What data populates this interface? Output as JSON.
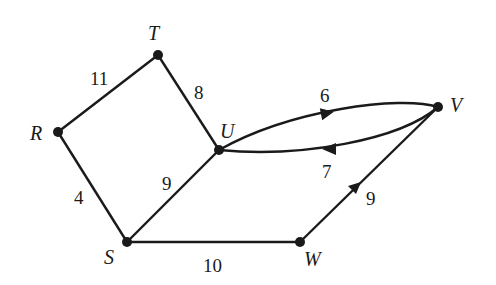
{
  "graph": {
    "nodes": [
      {
        "id": "T",
        "label": "T"
      },
      {
        "id": "R",
        "label": "R"
      },
      {
        "id": "U",
        "label": "U"
      },
      {
        "id": "V",
        "label": "V"
      },
      {
        "id": "S",
        "label": "S"
      },
      {
        "id": "W",
        "label": "W"
      }
    ],
    "edges": [
      {
        "from": "R",
        "to": "T",
        "weight": "11",
        "directed": false
      },
      {
        "from": "T",
        "to": "U",
        "weight": "8",
        "directed": false
      },
      {
        "from": "R",
        "to": "S",
        "weight": "4",
        "directed": false
      },
      {
        "from": "S",
        "to": "U",
        "weight": "9",
        "directed": false
      },
      {
        "from": "U",
        "to": "V",
        "weight": "6",
        "directed": true
      },
      {
        "from": "V",
        "to": "U",
        "weight": "7",
        "directed": true
      },
      {
        "from": "S",
        "to": "W",
        "weight": "10",
        "directed": false
      },
      {
        "from": "W",
        "to": "V",
        "weight": "9",
        "directed": true
      }
    ]
  }
}
